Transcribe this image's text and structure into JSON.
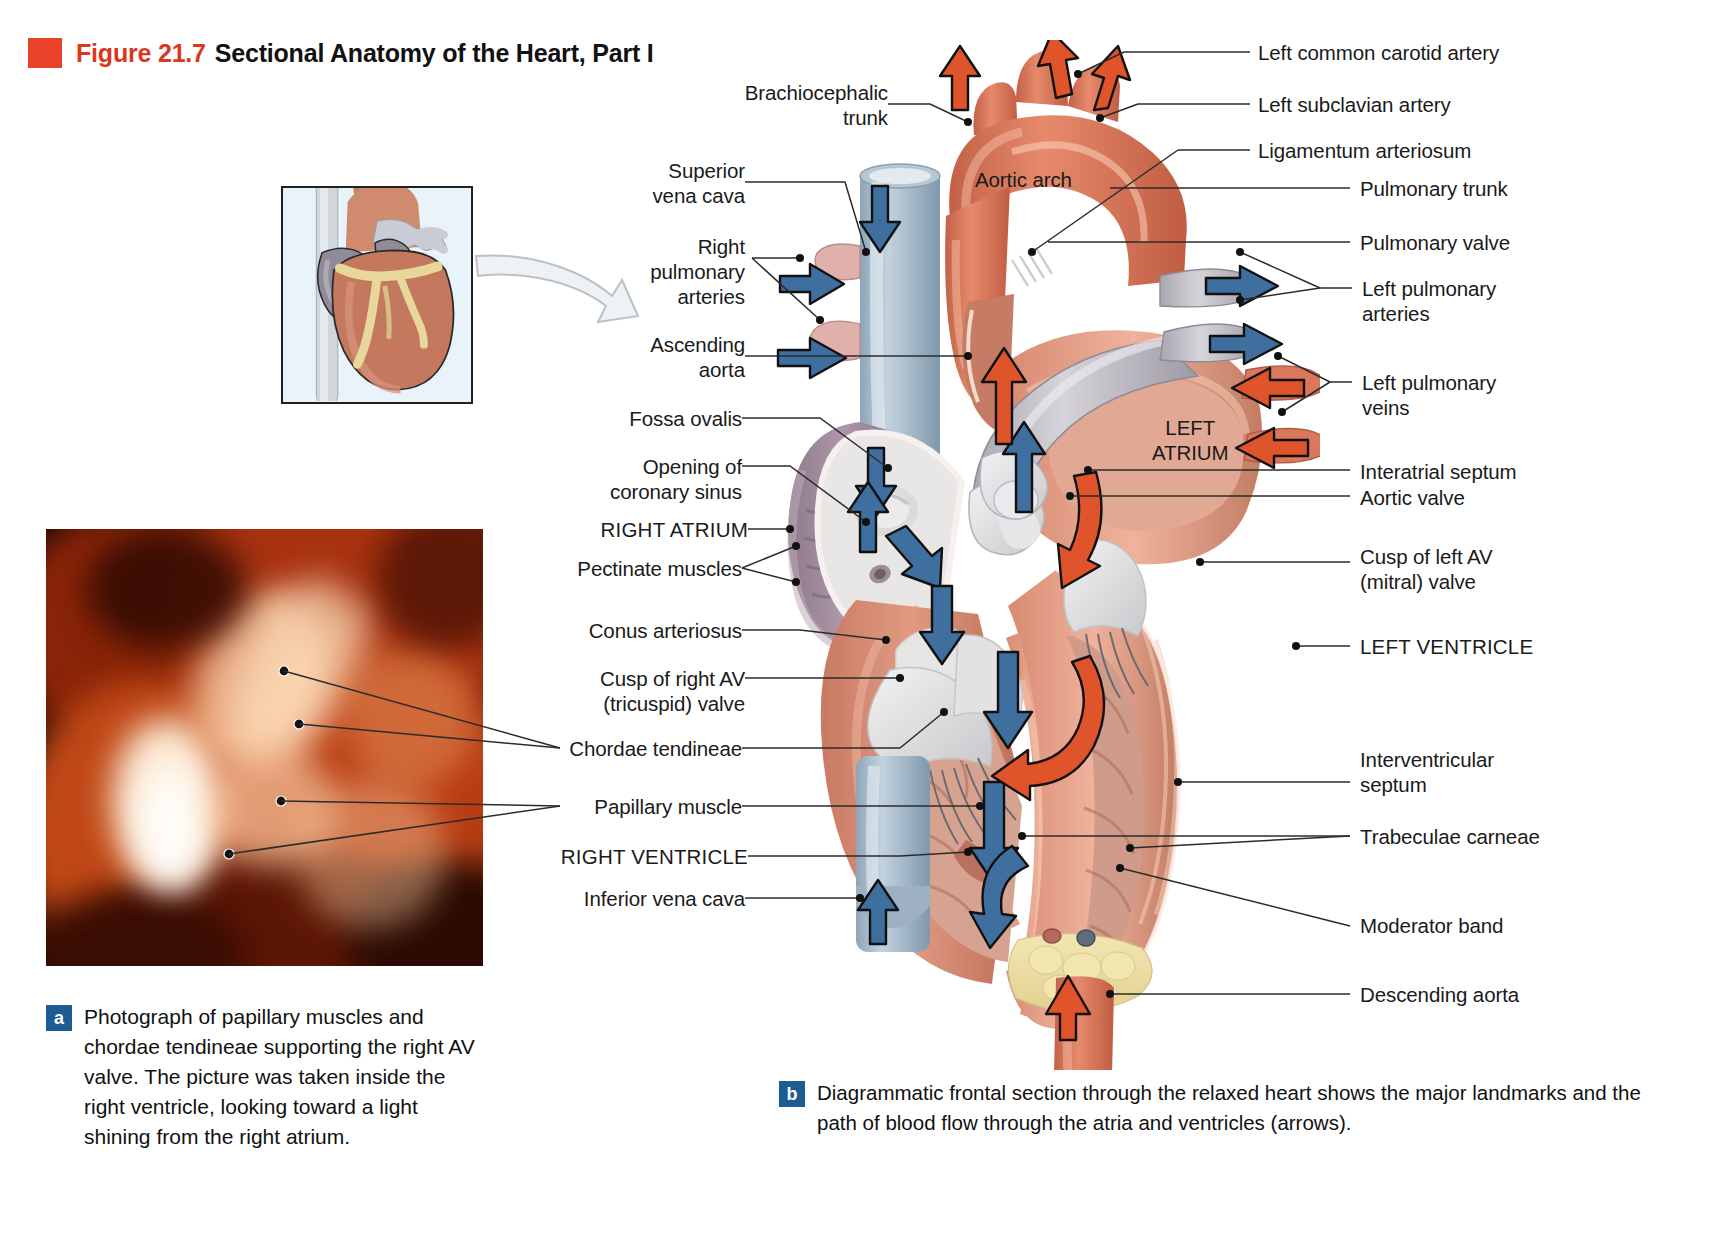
{
  "figure": {
    "number": "Figure 21.7",
    "title": "Sectional Anatomy of the Heart, Part I",
    "accent_color": "#d9381e",
    "swatch_color": "#e8422b",
    "badge_color": "#1d5c92"
  },
  "labels_left": [
    {
      "id": "brachiocephalic-trunk",
      "text": "Brachiocephalic\ntrunk"
    },
    {
      "id": "superior-vena-cava",
      "text": "Superior\nvena cava"
    },
    {
      "id": "right-pulmonary-arteries",
      "text": "Right\npulmonary\narteries"
    },
    {
      "id": "ascending-aorta",
      "text": "Ascending\naorta"
    },
    {
      "id": "fossa-ovalis",
      "text": "Fossa ovalis"
    },
    {
      "id": "opening-of-coronary-sinus",
      "text": "Opening of\ncoronary sinus"
    },
    {
      "id": "right-atrium",
      "text": "RIGHT ATRIUM"
    },
    {
      "id": "pectinate-muscles",
      "text": "Pectinate muscles"
    },
    {
      "id": "conus-arteriosus",
      "text": "Conus arteriosus"
    },
    {
      "id": "cusp-of-right-av-valve",
      "text": "Cusp of right AV\n(tricuspid) valve"
    },
    {
      "id": "chordae-tendineae",
      "text": "Chordae tendineae"
    },
    {
      "id": "papillary-muscle",
      "text": "Papillary muscle"
    },
    {
      "id": "right-ventricle",
      "text": "RIGHT VENTRICLE"
    },
    {
      "id": "inferior-vena-cava",
      "text": "Inferior vena cava"
    }
  ],
  "labels_right": [
    {
      "id": "left-common-carotid-artery",
      "text": "Left common carotid artery"
    },
    {
      "id": "left-subclavian-artery",
      "text": "Left subclavian artery"
    },
    {
      "id": "ligamentum-arteriosum",
      "text": "Ligamentum arteriosum"
    },
    {
      "id": "pulmonary-trunk",
      "text": "Pulmonary trunk"
    },
    {
      "id": "pulmonary-valve",
      "text": "Pulmonary valve"
    },
    {
      "id": "left-pulmonary-arteries",
      "text": "Left pulmonary\narteries"
    },
    {
      "id": "left-pulmonary-veins",
      "text": "Left pulmonary\nveins"
    },
    {
      "id": "interatrial-septum",
      "text": "Interatrial septum"
    },
    {
      "id": "aortic-valve",
      "text": "Aortic valve"
    },
    {
      "id": "cusp-of-left-av-valve",
      "text": "Cusp of left AV\n(mitral) valve"
    },
    {
      "id": "left-ventricle",
      "text": "LEFT VENTRICLE"
    },
    {
      "id": "interventricular-septum",
      "text": "Interventricular\nseptum"
    },
    {
      "id": "trabeculae-carneae",
      "text": "Trabeculae carneae"
    },
    {
      "id": "moderator-band",
      "text": "Moderator band"
    },
    {
      "id": "descending-aorta",
      "text": "Descending aorta"
    }
  ],
  "labels_inline": [
    {
      "id": "aortic-arch",
      "text": "Aortic arch"
    },
    {
      "id": "left-atrium",
      "text": "LEFT\nATRIUM"
    }
  ],
  "captions": {
    "a": {
      "badge": "a",
      "text": "Photograph of papillary muscles and chordae tendineae supporting the right AV valve. The picture was taken inside the right ventricle, looking toward a light shining from the right atrium."
    },
    "b": {
      "badge": "b",
      "text": "Diagrammatic frontal section through the relaxed heart shows the major landmarks and the path of blood flow through the atria and ventricles (arrows)."
    }
  },
  "flow_arrows": {
    "deoxygenated_color": "#3f6f9e",
    "oxygenated_color": "#e0542c"
  }
}
